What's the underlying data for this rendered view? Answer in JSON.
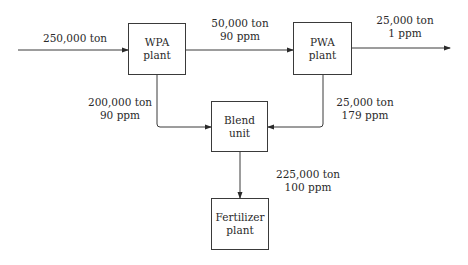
{
  "diagram": {
    "type": "process-flow",
    "nodes": [
      {
        "id": "wpa",
        "line1": "WPA",
        "line2": "plant"
      },
      {
        "id": "pwa",
        "line1": "PWA",
        "line2": "plant"
      },
      {
        "id": "blend",
        "line1": "Blend",
        "line2": "unit"
      },
      {
        "id": "fert",
        "line1": "Fertilizer",
        "line2": "plant"
      }
    ],
    "streams": {
      "feed": {
        "from": "external",
        "to": "wpa",
        "line1": "250,000 ton"
      },
      "wpa_to_pwa": {
        "from": "wpa",
        "to": "pwa",
        "line1": "50,000 ton",
        "line2": "90 ppm"
      },
      "pwa_out": {
        "from": "pwa",
        "to": "external",
        "line1": "25,000 ton",
        "line2": "1 ppm"
      },
      "wpa_to_blend": {
        "from": "wpa",
        "to": "blend",
        "line1": "200,000 ton",
        "line2": "90 ppm"
      },
      "pwa_to_blend": {
        "from": "pwa",
        "to": "blend",
        "line1": "25,000 ton",
        "line2": "179 ppm"
      },
      "blend_to_fert": {
        "from": "blend",
        "to": "fert",
        "line1": "225,000 ton",
        "line2": "100 ppm"
      }
    }
  }
}
